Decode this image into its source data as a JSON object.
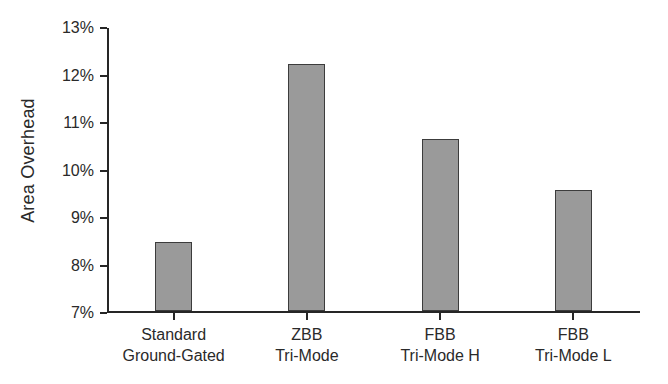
{
  "chart_data": {
    "type": "bar",
    "title": "",
    "xlabel": "",
    "ylabel": "Area Overhead",
    "categories": [
      "Standard Ground-Gated",
      "ZBB Tri-Mode",
      "FBB Tri-Mode H",
      "FBB Tri-Mode L"
    ],
    "category_lines": [
      [
        "Standard",
        "Ground-Gated"
      ],
      [
        "ZBB",
        "Tri-Mode"
      ],
      [
        "FBB",
        "Tri-Mode H"
      ],
      [
        "FBB",
        "Tri-Mode L"
      ]
    ],
    "values": [
      8.45,
      12.2,
      10.62,
      9.55
    ],
    "value_unit": "%",
    "ylim": [
      7,
      13
    ],
    "ytick_values": [
      7,
      8,
      9,
      10,
      11,
      12,
      13
    ],
    "ytick_labels": [
      "7%",
      "8%",
      "9%",
      "10%",
      "11%",
      "12%",
      "13%"
    ],
    "grid": false,
    "legend": false,
    "bar_color": "#9a9a9a",
    "bar_edge_color": "#3c3c3c",
    "axis_color": "#262626",
    "background_color": "#ffffff"
  }
}
